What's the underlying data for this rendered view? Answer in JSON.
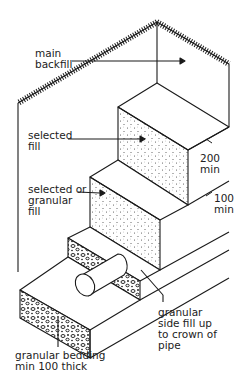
{
  "diagram": {
    "title_cropped": "",
    "labels": {
      "main_backfill": "main\nbackfill",
      "selected_fill": "selected\nfill",
      "dim_200": "200\nmin",
      "selected_or_granular": "selected or\ngranular\nfill",
      "dim_100": "100\nmin",
      "side_fill": "granular\nside fill up\nto crown of\npipe",
      "bedding": "granular bedding\nmin 100 thick"
    },
    "colors": {
      "line": "#1a1a1a",
      "background": "#ffffff"
    }
  }
}
